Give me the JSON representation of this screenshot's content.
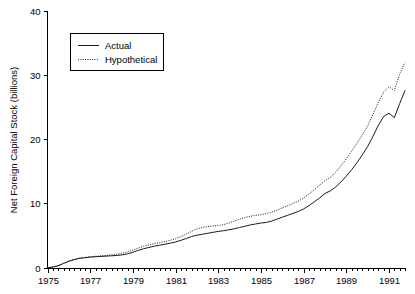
{
  "chart_data": {
    "type": "line",
    "title": "",
    "xlabel": "",
    "ylabel": "Net Foreign Capital Stock (billions)",
    "xlim": [
      1975,
      1991.75
    ],
    "ylim": [
      0,
      40
    ],
    "grid": false,
    "legend_position": "top-left",
    "x_ticks_major": [
      "1975",
      "1977",
      "1979",
      "1981",
      "1983",
      "1985",
      "1987",
      "1989",
      "1991"
    ],
    "x_tick_values_major": [
      1975,
      1977,
      1979,
      1981,
      1983,
      1985,
      1987,
      1989,
      1991
    ],
    "x_minor_tick_interval": 0.25,
    "y_ticks": [
      "0",
      "10",
      "20",
      "30",
      "40"
    ],
    "y_tick_values": [
      0,
      10,
      20,
      30,
      40
    ],
    "x": [
      1975,
      1975.25,
      1975.5,
      1975.75,
      1976,
      1976.25,
      1976.5,
      1976.75,
      1977,
      1977.25,
      1977.5,
      1977.75,
      1978,
      1978.25,
      1978.5,
      1978.75,
      1979,
      1979.25,
      1979.5,
      1979.75,
      1980,
      1980.25,
      1980.5,
      1980.75,
      1981,
      1981.25,
      1981.5,
      1981.75,
      1982,
      1982.25,
      1982.5,
      1982.75,
      1983,
      1983.25,
      1983.5,
      1983.75,
      1984,
      1984.25,
      1984.5,
      1984.75,
      1985,
      1985.25,
      1985.5,
      1985.75,
      1986,
      1986.25,
      1986.5,
      1986.75,
      1987,
      1987.25,
      1987.5,
      1987.75,
      1988,
      1988.25,
      1988.5,
      1988.75,
      1989,
      1989.25,
      1989.5,
      1989.75,
      1990,
      1990.25,
      1990.5,
      1990.75,
      1991,
      1991.25,
      1991.5,
      1991.75
    ],
    "series": [
      {
        "name": "Actual",
        "style": "solid",
        "color": "#1a1a1a",
        "values": [
          0.05,
          0.15,
          0.35,
          0.7,
          1.05,
          1.3,
          1.5,
          1.6,
          1.7,
          1.75,
          1.8,
          1.85,
          1.9,
          1.95,
          2.05,
          2.2,
          2.45,
          2.75,
          3.0,
          3.2,
          3.4,
          3.55,
          3.7,
          3.85,
          4.05,
          4.3,
          4.6,
          4.9,
          5.1,
          5.25,
          5.4,
          5.55,
          5.7,
          5.8,
          5.95,
          6.1,
          6.3,
          6.5,
          6.7,
          6.85,
          7.0,
          7.1,
          7.3,
          7.6,
          7.9,
          8.2,
          8.5,
          8.8,
          9.2,
          9.7,
          10.3,
          10.9,
          11.6,
          12.0,
          12.6,
          13.4,
          14.3,
          15.3,
          16.4,
          17.6,
          18.9,
          20.5,
          22.2,
          23.6,
          24.1,
          23.4,
          25.6,
          27.6
        ]
      },
      {
        "name": "Hypothetical",
        "style": "dotted",
        "color": "#1a1a1a",
        "values": [
          0.05,
          0.15,
          0.35,
          0.72,
          1.08,
          1.34,
          1.55,
          1.65,
          1.75,
          1.82,
          1.9,
          1.97,
          2.05,
          2.15,
          2.3,
          2.5,
          2.8,
          3.1,
          3.4,
          3.6,
          3.8,
          3.95,
          4.1,
          4.3,
          4.55,
          4.9,
          5.3,
          5.7,
          6.1,
          6.3,
          6.45,
          6.55,
          6.6,
          6.75,
          7.0,
          7.3,
          7.6,
          7.85,
          8.05,
          8.2,
          8.3,
          8.45,
          8.7,
          9.0,
          9.35,
          9.7,
          10.05,
          10.4,
          10.9,
          11.5,
          12.2,
          12.9,
          13.6,
          14.1,
          14.9,
          15.9,
          17.0,
          18.2,
          19.4,
          20.7,
          22.1,
          23.9,
          25.8,
          27.4,
          28.2,
          27.6,
          30.2,
          32.0
        ]
      }
    ],
    "legend": [
      {
        "label": "Actual",
        "style": "solid"
      },
      {
        "label": "Hypothetical",
        "style": "dotted"
      }
    ]
  }
}
